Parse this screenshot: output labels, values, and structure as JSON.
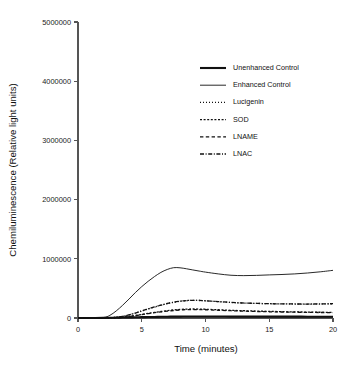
{
  "chart_data": {
    "type": "line",
    "title": "",
    "xlabel": "Time (minutes)",
    "ylabel": "Chemiluminescence (Relative light units)",
    "xlim": [
      0,
      20
    ],
    "ylim": [
      0,
      5000000
    ],
    "xticks": [
      0,
      5,
      10,
      15,
      20
    ],
    "xtick_labels": [
      "0",
      "5",
      "10",
      "15",
      "20"
    ],
    "yticks": [
      0,
      1000000,
      2000000,
      3000000,
      4000000,
      5000000
    ],
    "ytick_labels": [
      "0",
      "1000000",
      "2000000",
      "3000000",
      "4000000",
      "5000000"
    ],
    "grid": false,
    "legend_position": "upper-right-inside",
    "x": [
      0,
      1,
      2,
      2.5,
      3,
      3.5,
      4,
      4.5,
      5,
      5.5,
      6,
      6.5,
      7,
      7.5,
      8,
      8.5,
      9,
      9.5,
      10,
      11,
      12,
      13,
      14,
      15,
      16,
      17,
      18,
      19,
      20
    ],
    "series": [
      {
        "name": "Unenhanced Control",
        "style": "solid",
        "width": 2.1,
        "values": [
          0,
          0,
          2000,
          4000,
          6000,
          8000,
          10000,
          12000,
          14000,
          16000,
          18000,
          20000,
          22000,
          23000,
          24000,
          25000,
          25000,
          25000,
          25000,
          25000,
          24000,
          24000,
          24000,
          23000,
          23000,
          23000,
          22000,
          22000,
          22000
        ]
      },
      {
        "name": "Enhanced Control",
        "style": "solid",
        "width": 0.9,
        "values": [
          0,
          2000,
          8000,
          45000,
          120000,
          215000,
          320000,
          430000,
          530000,
          620000,
          700000,
          770000,
          820000,
          850000,
          848000,
          832000,
          812000,
          793000,
          775000,
          745000,
          722000,
          716000,
          720000,
          728000,
          735000,
          745000,
          760000,
          780000,
          805000
        ]
      },
      {
        "name": "Lucigenin",
        "style": "dotted",
        "width": 1.3,
        "dash": "1,2",
        "values": [
          0,
          0,
          2000,
          5000,
          12000,
          28000,
          52000,
          82000,
          118000,
          152000,
          185000,
          215000,
          243000,
          265000,
          283000,
          294000,
          298000,
          296000,
          290000,
          276000,
          262000,
          252000,
          246000,
          241000,
          238000,
          236000,
          235000,
          236000,
          240000
        ]
      },
      {
        "name": "SOD",
        "style": "dense-dash",
        "width": 1.3,
        "dash": "2,1.6",
        "values": [
          0,
          0,
          1000,
          2500,
          6000,
          14000,
          26000,
          42000,
          60000,
          78000,
          95000,
          110000,
          124000,
          136000,
          145000,
          150000,
          152000,
          151000,
          148000,
          139000,
          130000,
          123000,
          117000,
          112000,
          107000,
          103000,
          100000,
          97000,
          95000
        ]
      },
      {
        "name": "LNAME",
        "style": "dash",
        "width": 1.3,
        "dash": "3.4,2.4",
        "values": [
          0,
          0,
          1000,
          2200,
          5500,
          13000,
          24000,
          39000,
          56000,
          73000,
          89000,
          103000,
          116000,
          127000,
          136000,
          141000,
          143000,
          142000,
          139000,
          131000,
          123000,
          116000,
          110000,
          105000,
          101000,
          98000,
          95000,
          93000,
          92000
        ]
      },
      {
        "name": "LNAC",
        "style": "dash-dot",
        "width": 1.3,
        "dash": "4,1.6,1,1.6",
        "values": [
          0,
          0,
          2000,
          5200,
          12500,
          29000,
          53000,
          84000,
          120000,
          154000,
          187000,
          217000,
          245000,
          267000,
          284000,
          295000,
          299000,
          297000,
          291000,
          277000,
          263000,
          253000,
          247000,
          242000,
          239000,
          237000,
          236000,
          238000,
          242000
        ]
      }
    ],
    "colors": {
      "ink": "#111111",
      "axis": "#555555",
      "background": "#ffffff"
    }
  },
  "legend": {
    "items": [
      {
        "label": "Unenhanced Control"
      },
      {
        "label": "Enhanced Control"
      },
      {
        "label": "Lucigenin"
      },
      {
        "label": "SOD"
      },
      {
        "label": "LNAME"
      },
      {
        "label": "LNAC"
      }
    ]
  }
}
